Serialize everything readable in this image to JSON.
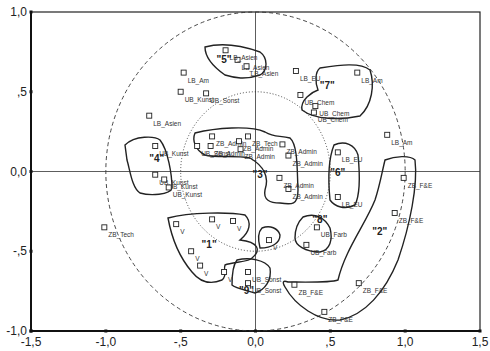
{
  "chart_data": {
    "type": "scatter",
    "title": "",
    "xlabel": "",
    "ylabel": "",
    "xlim": [
      -1.5,
      1.5
    ],
    "ylim": [
      -1.0,
      1.0
    ],
    "x_ticks": [
      "-1,5",
      "-1,0",
      "-,5",
      "0,0",
      ",5",
      "1,0",
      "1,5"
    ],
    "y_ticks": [
      "1,0",
      ",5",
      "0,0",
      "-,5",
      "-1,0"
    ],
    "grid": false,
    "reference_circles": [
      {
        "radius": 1.0,
        "style": "dashed"
      },
      {
        "radius": 0.5,
        "style": "dotted"
      }
    ],
    "points": [
      {
        "label": "LB_Asien",
        "x": -0.12,
        "y": 0.7
      },
      {
        "label": "LB_Asien",
        "x": -0.2,
        "y": 0.76
      },
      {
        "label": "LB_Asien",
        "x": -0.06,
        "y": 0.66
      },
      {
        "label": "LB_Am",
        "x": -0.48,
        "y": 0.62
      },
      {
        "label": "UB_Kunst",
        "x": -0.5,
        "y": 0.5
      },
      {
        "label": "UB_Sonst",
        "x": -0.33,
        "y": 0.49
      },
      {
        "label": "LB_Asien",
        "x": -0.71,
        "y": 0.35
      },
      {
        "label": "LB_EU",
        "x": 0.27,
        "y": 0.63
      },
      {
        "label": "LB_Am",
        "x": 0.68,
        "y": 0.62
      },
      {
        "label": "UB_Chem",
        "x": 0.3,
        "y": 0.48
      },
      {
        "label": "UB_Chem",
        "x": 0.4,
        "y": 0.41
      },
      {
        "label": "UB_Chem",
        "x": 0.39,
        "y": 0.37
      },
      {
        "label": "LB_Am",
        "x": 0.88,
        "y": 0.23
      },
      {
        "label": "ZB_Admin",
        "x": -0.29,
        "y": 0.22
      },
      {
        "label": "ZB_Tech",
        "x": -0.05,
        "y": 0.22
      },
      {
        "label": "ZB_Admin",
        "x": -0.11,
        "y": 0.19
      },
      {
        "label": "ZB_Admin",
        "x": -0.3,
        "y": 0.16
      },
      {
        "label": "ZB_Admin",
        "x": -0.1,
        "y": 0.14
      },
      {
        "label": "ZB_Admin",
        "x": 0.22,
        "y": 0.1
      },
      {
        "label": "ZB_Admin",
        "x": 0.18,
        "y": 0.17
      },
      {
        "label": "ZB_Admin",
        "x": 0.22,
        "y": -0.11
      },
      {
        "label": "ZB_Admin",
        "x": 0.16,
        "y": -0.04
      },
      {
        "label": "UB_Sonst",
        "x": -0.39,
        "y": 0.16
      },
      {
        "label": "UB_Kunst",
        "x": -0.67,
        "y": 0.16
      },
      {
        "label": "UB_Kunst",
        "x": -0.67,
        "y": -0.02
      },
      {
        "label": "UB_Kunst",
        "x": -0.61,
        "y": -0.05
      },
      {
        "label": "UB_Kunst",
        "x": -0.58,
        "y": -0.1
      },
      {
        "label": "LB_EU",
        "x": 0.55,
        "y": 0.12
      },
      {
        "label": "LB_EU",
        "x": 0.55,
        "y": -0.16
      },
      {
        "label": "ZB_F&E",
        "x": 0.99,
        "y": -0.04
      },
      {
        "label": "ZB_F&E",
        "x": 0.93,
        "y": -0.26
      },
      {
        "label": "UB_Farb",
        "x": 0.41,
        "y": -0.35
      },
      {
        "label": "UB_Farb",
        "x": 0.34,
        "y": -0.46
      },
      {
        "label": "ZB_F&E",
        "x": 0.69,
        "y": -0.7
      },
      {
        "label": "ZB_F&E",
        "x": 0.26,
        "y": -0.71
      },
      {
        "label": "ZB_F&E",
        "x": 0.46,
        "y": -0.88
      },
      {
        "label": "V",
        "x": -0.53,
        "y": -0.33
      },
      {
        "label": "V",
        "x": -0.29,
        "y": -0.3
      },
      {
        "label": "V",
        "x": -0.15,
        "y": -0.31
      },
      {
        "label": "V",
        "x": -0.43,
        "y": -0.5
      },
      {
        "label": "V",
        "x": -0.37,
        "y": -0.59
      },
      {
        "label": "V",
        "x": -0.21,
        "y": -0.63
      },
      {
        "label": "V",
        "x": 0.09,
        "y": -0.43
      },
      {
        "label": "UB_Sonst",
        "x": -0.05,
        "y": -0.63
      },
      {
        "label": "UB_Sonst",
        "x": -0.05,
        "y": -0.7
      },
      {
        "label": "ZB_Tech",
        "x": -1.01,
        "y": -0.35
      }
    ],
    "clusters": [
      {
        "label": "\"1\"",
        "x": -0.31,
        "y": -0.48
      },
      {
        "label": "\"2\"",
        "x": 0.83,
        "y": -0.4
      },
      {
        "label": "\"3\"",
        "x": 0.03,
        "y": -0.04
      },
      {
        "label": "\"4\"",
        "x": -0.66,
        "y": 0.06
      },
      {
        "label": "\"5\"",
        "x": -0.21,
        "y": 0.68
      },
      {
        "label": "\"6\"",
        "x": 0.55,
        "y": -0.03
      },
      {
        "label": "\"7\"",
        "x": 0.48,
        "y": 0.52
      },
      {
        "label": "\"8\"",
        "x": 0.43,
        "y": -0.32
      },
      {
        "label": "\"9\"",
        "x": -0.06,
        "y": -0.77
      }
    ]
  }
}
